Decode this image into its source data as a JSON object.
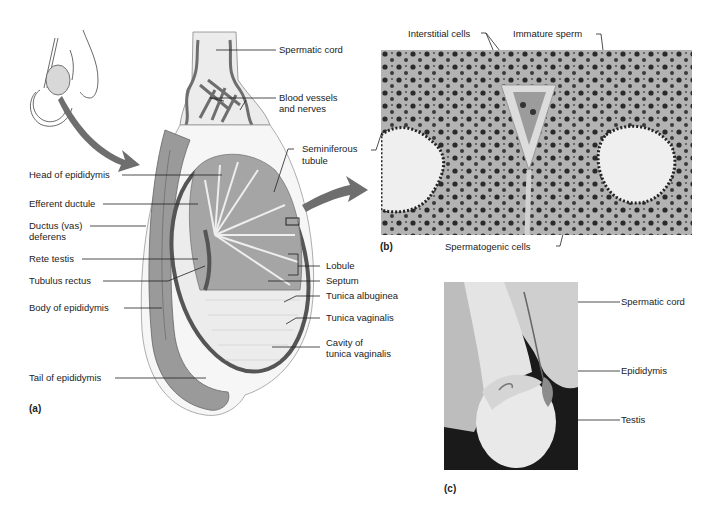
{
  "figure": {
    "panel_a": {
      "label": "(a)",
      "labels_left": [
        {
          "id": "head_epididymis",
          "text": "Head of epididymis"
        },
        {
          "id": "efferent_ductule",
          "text": "Efferent ductule"
        },
        {
          "id": "ductus_deferens_1",
          "text": "Ductus (vas)"
        },
        {
          "id": "ductus_deferens_2",
          "text": "deferens"
        },
        {
          "id": "rete_testis",
          "text": "Rete testis"
        },
        {
          "id": "tubulus_rectus",
          "text": "Tubulus rectus"
        },
        {
          "id": "body_epididymis",
          "text": "Body of epididymis"
        },
        {
          "id": "tail_epididymis",
          "text": "Tail of epididymis"
        }
      ],
      "labels_right": [
        {
          "id": "spermatic_cord",
          "text": "Spermatic cord"
        },
        {
          "id": "blood_vessels_1",
          "text": "Blood vessels"
        },
        {
          "id": "blood_vessels_2",
          "text": "and nerves"
        },
        {
          "id": "seminiferous_1",
          "text": "Seminiferous"
        },
        {
          "id": "seminiferous_2",
          "text": "tubule"
        },
        {
          "id": "lobule",
          "text": "Lobule"
        },
        {
          "id": "septum",
          "text": "Septum"
        },
        {
          "id": "tunica_albuginea",
          "text": "Tunica albuginea"
        },
        {
          "id": "tunica_vaginalis",
          "text": "Tunica vaginalis"
        },
        {
          "id": "cavity_1",
          "text": "Cavity of"
        },
        {
          "id": "cavity_2",
          "text": "tunica vaginalis"
        }
      ]
    },
    "panel_b": {
      "label": "(b)",
      "labels": [
        {
          "id": "interstitial",
          "text": "Interstitial cells"
        },
        {
          "id": "immature_sperm",
          "text": "Immature sperm"
        },
        {
          "id": "spermatogenic",
          "text": "Spermatogenic cells"
        }
      ]
    },
    "panel_c": {
      "label": "(c)",
      "labels": [
        {
          "id": "spermatic_cord_c",
          "text": "Spermatic cord"
        },
        {
          "id": "epididymis_c",
          "text": "Epididymis"
        },
        {
          "id": "testis_c",
          "text": "Testis"
        }
      ]
    },
    "colors": {
      "line": "#222222",
      "tubule_fill": "#9a9a9a",
      "tunica_dark": "#555555",
      "arrow": "#6e6e6e",
      "micrograph_bg": "#b9b9b9",
      "photo_bg": "#1a1a1a"
    }
  }
}
